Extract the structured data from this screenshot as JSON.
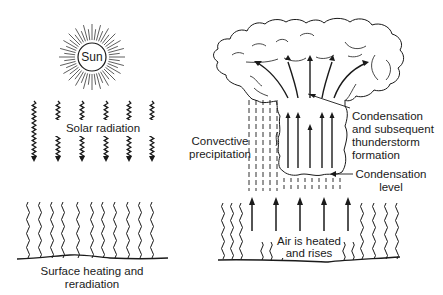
{
  "colors": {
    "background": "#ffffff",
    "ink": "#1a1a1a",
    "light_ink": "#555555"
  },
  "left_panel": {
    "sun": {
      "label": "Sun",
      "cx": 92,
      "cy": 57,
      "r": 14,
      "ray_inner": 17,
      "ray_outer": 33,
      "ray_count": 48
    },
    "solar_radiation": {
      "label": "Solar radiation",
      "arrow_x": [
        34,
        58,
        82,
        106,
        129,
        152
      ],
      "y_top": 101,
      "y_bottom": 162
    },
    "surface": {
      "label_line1": "Surface heating and",
      "label_line2": "reradiation",
      "squiggle_x": [
        28,
        40,
        52,
        63,
        78,
        92,
        103,
        115,
        128,
        140,
        152
      ],
      "y_top": 196,
      "y_bottom": 258
    }
  },
  "right_panel": {
    "labels": {
      "convective_line1": "Convective",
      "convective_line2": "precipitation",
      "condensation_thunder_line1": "Condensation",
      "condensation_thunder_line2": "and subsequent",
      "condensation_thunder_line3": "thunderstorm",
      "condensation_thunder_line4": "formation",
      "condensation_level_line1": "Condensation",
      "condensation_level_line2": "level",
      "air_line1": "Air is heated",
      "air_line2": "and rises"
    },
    "up_arrows_x": [
      252,
      276,
      300,
      324,
      348
    ],
    "cloud_arrows_x": [
      288,
      298,
      310,
      322,
      332
    ],
    "rain_x": [
      249,
      256,
      263,
      270,
      277
    ],
    "under_cloud_rain_x": [
      284,
      291,
      298,
      305,
      312,
      319,
      326,
      333,
      340
    ],
    "tall_squiggles_x": [
      223,
      232,
      241,
      362,
      374,
      386,
      397
    ],
    "short_squiggles_x": [
      262,
      271,
      282,
      344,
      353
    ]
  }
}
